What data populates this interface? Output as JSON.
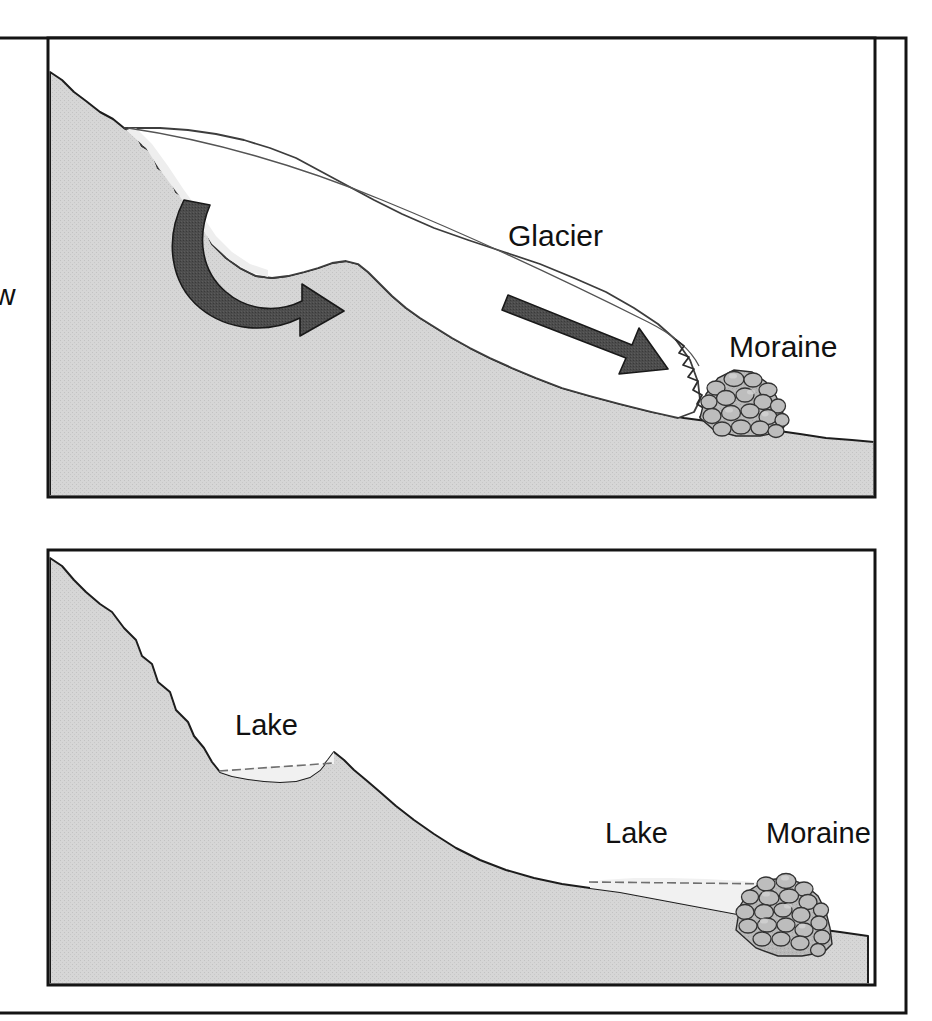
{
  "figure": {
    "kind": "two-panel cross-section diagram",
    "panel_count": 2,
    "frame": {
      "border_color": "#111111",
      "background_color": "#ffffff"
    },
    "palette": {
      "bedrock_fill": "#d4d4d4",
      "bedrock_outline": "#1a1a1a",
      "glacier_ice_fill": "#ffffff",
      "glacier_ice_outline": "#3a3a3a",
      "firn_snow_fill": "#efefef",
      "lake_fill": "#f2f2f2",
      "lake_surface_line": "#6b6b6b",
      "arrow_fill": "#4a4a4a",
      "arrow_outline": "#1a1a1a",
      "rock_fill": "#b6b6b6",
      "rock_highlight": "#cfcfcf",
      "rock_outline": "#2b2b2b",
      "text_color": "#111111"
    },
    "cropped_left_text": "w"
  },
  "panels": [
    {
      "id": "panel-top",
      "name": "glacier-active-panel",
      "position": {
        "x": 48,
        "y": 38,
        "width": 827,
        "height": 459
      },
      "description": "Valley with an active glacier flowing downslope, depositing a terminal moraine",
      "labels": [
        {
          "id": "glacier-label",
          "text": "Glacier",
          "x": 508,
          "y": 246
        },
        {
          "id": "moraine-label-top",
          "text": "Moraine",
          "x": 729,
          "y": 357
        }
      ],
      "features": [
        {
          "id": "bedrock",
          "name": "bedrock-slope",
          "text": ""
        },
        {
          "id": "glacier",
          "name": "glacier-ice-body",
          "text": ""
        },
        {
          "id": "firn",
          "name": "firn-snow-band",
          "text": ""
        },
        {
          "id": "arrow-curved",
          "name": "ice-flow-arrow-curved",
          "text": ""
        },
        {
          "id": "arrow-straight",
          "name": "ice-flow-arrow-straight",
          "text": ""
        },
        {
          "id": "terminus",
          "name": "glacier-terminus-jagged",
          "text": ""
        },
        {
          "id": "moraine-rocks",
          "name": "terminal-moraine-rock-pile",
          "text": ""
        }
      ]
    },
    {
      "id": "panel-bottom",
      "name": "post-glacial-panel",
      "position": {
        "x": 48,
        "y": 550,
        "width": 827,
        "height": 435
      },
      "description": "Same valley after the glacier melted, leaving a cirque tarn and a moraine-dammed lake",
      "labels": [
        {
          "id": "lake-label-upper",
          "text": "Lake",
          "x": 235,
          "y": 735
        },
        {
          "id": "lake-label-lower",
          "text": "Lake",
          "x": 605,
          "y": 843
        },
        {
          "id": "moraine-label-bottom",
          "text": "Moraine",
          "x": 766,
          "y": 843
        }
      ],
      "features": [
        {
          "id": "bedrock",
          "name": "bedrock-slope",
          "text": ""
        },
        {
          "id": "tarn",
          "name": "cirque-tarn-lake",
          "text": ""
        },
        {
          "id": "moraine-lake",
          "name": "moraine-dammed-lake",
          "text": ""
        },
        {
          "id": "moraine-rocks",
          "name": "terminal-moraine-rock-pile",
          "text": ""
        }
      ]
    }
  ]
}
